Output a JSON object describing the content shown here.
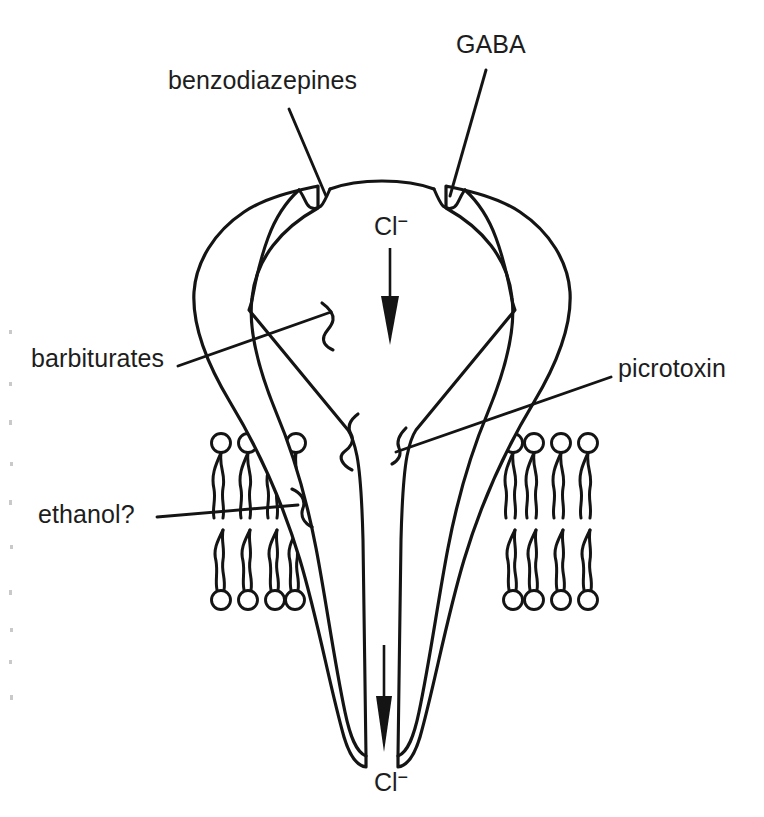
{
  "figure": {
    "kind": "scientific-line-diagram",
    "background_color": "#ffffff",
    "ink_color": "#141414"
  },
  "labels": {
    "benzodiazepines": "benzodiazepines",
    "gaba": "GABA",
    "barbiturates": "barbiturates",
    "picrotoxin": "picrotoxin",
    "ethanol": "ethanol?"
  },
  "ions": {
    "chloride_symbol": "Cl",
    "chloride_charge": "−",
    "top_label": "Cl",
    "bottom_label": "Cl"
  },
  "binding_sites": [
    {
      "name": "benzodiazepines",
      "location": "upper-left-notch",
      "label_x": 168,
      "label_y": 68
    },
    {
      "name": "GABA",
      "location": "upper-right-notch",
      "label_x": 456,
      "label_y": 32
    },
    {
      "name": "barbiturates",
      "location": "mid-left-notch",
      "label_x": 31,
      "label_y": 346
    },
    {
      "name": "picrotoxin",
      "location": "pore-constriction",
      "label_x": 618,
      "label_y": 356
    },
    {
      "name": "ethanol?",
      "location": "membrane-level-left-notch",
      "label_x": 38,
      "label_y": 502
    }
  ],
  "membrane": {
    "name": "phospholipid-bilayer",
    "leaflets": 2,
    "lipids_per_leaflet": 4,
    "sides": [
      "left",
      "right"
    ],
    "upper_leaflet_head_direction": "up",
    "lower_leaflet_head_direction": "down"
  },
  "flow": {
    "direction": "downward",
    "ion": "Cl",
    "arrows": 2
  }
}
